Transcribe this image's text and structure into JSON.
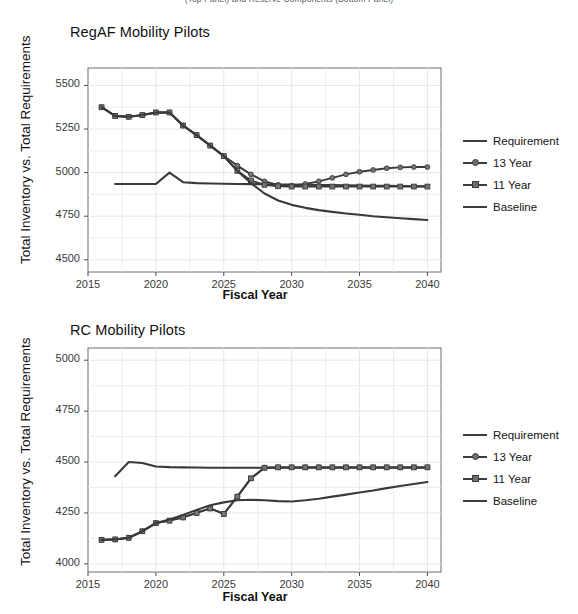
{
  "figure": {
    "supertitle": "(Top Panel) and Reserve Components (Bottom Panel)",
    "axis_label_x": "Fiscal Year",
    "axis_label_y": "Total Inventory vs. Total Requirements"
  },
  "legend": {
    "position": "right",
    "items": [
      {
        "label": "Requirement",
        "marker": "none",
        "color": "#3a3a3a"
      },
      {
        "label": "13 Year",
        "marker": "circle",
        "color": "#3a3a3a"
      },
      {
        "label": "11 Year",
        "marker": "square",
        "color": "#3a3a3a"
      },
      {
        "label": "Baseline",
        "marker": "none",
        "color": "#3a3a3a"
      }
    ]
  },
  "chart_data": [
    {
      "type": "line",
      "title": "RegAF Mobility Pilots",
      "xlabel": "Fiscal Year",
      "ylabel": "Total Inventory vs. Total Requirements",
      "xlim": [
        2015,
        2041
      ],
      "ylim": [
        4430,
        5600
      ],
      "xticks": [
        2015,
        2020,
        2025,
        2030,
        2035,
        2040
      ],
      "yticks": [
        4500,
        4750,
        5000,
        5250,
        5500
      ],
      "grid": true,
      "x": [
        2016,
        2017,
        2018,
        2019,
        2020,
        2021,
        2022,
        2023,
        2024,
        2025,
        2026,
        2027,
        2028,
        2029,
        2030,
        2031,
        2032,
        2033,
        2034,
        2035,
        2036,
        2037,
        2038,
        2039,
        2040
      ],
      "series": [
        {
          "name": "Requirement",
          "marker": "none",
          "values": [
            4935,
            4935,
            4935,
            4935,
            5000,
            4945,
            4940,
            4938,
            4936,
            4935,
            4934,
            4933,
            4932,
            4931,
            4930,
            4929,
            4928,
            4927,
            4926,
            4925,
            4924,
            4923,
            4922,
            4921,
            4920
          ],
          "x_start": 2017
        },
        {
          "name": "13 Year",
          "marker": "circle",
          "values": [
            5375,
            5325,
            5320,
            5330,
            5345,
            5345,
            5270,
            5215,
            5155,
            5095,
            5040,
            4990,
            4950,
            4930,
            4925,
            4935,
            4950,
            4970,
            4990,
            5005,
            5015,
            5025,
            5030,
            5032,
            5032
          ]
        },
        {
          "name": "11 Year",
          "marker": "square",
          "values": [
            5375,
            5325,
            5320,
            5330,
            5345,
            5345,
            5270,
            5215,
            5155,
            5095,
            5010,
            4955,
            4930,
            4922,
            4920,
            4920,
            4920,
            4920,
            4920,
            4920,
            4920,
            4920,
            4920,
            4920,
            4920
          ]
        },
        {
          "name": "Baseline",
          "marker": "none",
          "values": [
            5375,
            5325,
            5320,
            5330,
            5345,
            5345,
            5270,
            5215,
            5155,
            5095,
            5010,
            4940,
            4880,
            4840,
            4815,
            4798,
            4785,
            4775,
            4766,
            4758,
            4750,
            4744,
            4738,
            4733,
            4728
          ]
        }
      ]
    },
    {
      "type": "line",
      "title": "RC Mobility Pilots",
      "xlabel": "Fiscal Year",
      "ylabel": "Total Inventory vs. Total Requirements",
      "xlim": [
        2015,
        2041
      ],
      "ylim": [
        3960,
        5060
      ],
      "xticks": [
        2015,
        2020,
        2025,
        2030,
        2035,
        2040
      ],
      "yticks": [
        4000,
        4250,
        4500,
        4750,
        5000
      ],
      "grid": true,
      "x": [
        2016,
        2017,
        2018,
        2019,
        2020,
        2021,
        2022,
        2023,
        2024,
        2025,
        2026,
        2027,
        2028,
        2029,
        2030,
        2031,
        2032,
        2033,
        2034,
        2035,
        2036,
        2037,
        2038,
        2039,
        2040
      ],
      "series": [
        {
          "name": "Requirement",
          "marker": "none",
          "values": [
            4430,
            4500,
            4495,
            4478,
            4475,
            4474,
            4473,
            4472,
            4472,
            4472,
            4472,
            4472,
            4472,
            4472,
            4472,
            4472,
            4472,
            4472,
            4472,
            4472,
            4472,
            4472,
            4472,
            4472
          ],
          "x_start": 2017
        },
        {
          "name": "13 Year",
          "marker": "circle",
          "values": [
            4118,
            4120,
            4128,
            4160,
            4200,
            4212,
            4228,
            4250,
            4272,
            4245,
            4330,
            4420,
            4472,
            4474,
            4474,
            4474,
            4474,
            4474,
            4474,
            4474,
            4474,
            4474,
            4474,
            4474,
            4474
          ]
        },
        {
          "name": "11 Year",
          "marker": "square",
          "values": [
            4118,
            4120,
            4128,
            4160,
            4200,
            4212,
            4228,
            4250,
            4272,
            4245,
            4330,
            4420,
            4472,
            4474,
            4474,
            4474,
            4474,
            4474,
            4474,
            4474,
            4474,
            4474,
            4474,
            4474,
            4474
          ]
        },
        {
          "name": "Baseline",
          "marker": "none",
          "values": [
            4118,
            4120,
            4128,
            4160,
            4200,
            4218,
            4240,
            4265,
            4288,
            4302,
            4312,
            4315,
            4312,
            4308,
            4306,
            4312,
            4320,
            4330,
            4340,
            4350,
            4360,
            4372,
            4382,
            4392,
            4402
          ]
        }
      ]
    }
  ]
}
